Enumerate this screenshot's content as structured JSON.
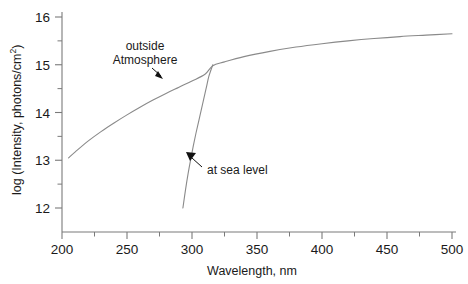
{
  "chart_data": {
    "type": "line",
    "title": "",
    "xlabel": "Wavelength, nm",
    "ylabel_parts": {
      "prefix": "log (Intensity, photons/cm",
      "superscript": "2",
      "suffix": ")"
    },
    "ylabel": "log (Intensity, photons/cm2)",
    "xlim": [
      200,
      500
    ],
    "ylim": [
      12,
      16
    ],
    "xticks": [
      200,
      250,
      300,
      350,
      400,
      450,
      500
    ],
    "xtick_labels": [
      "200",
      "250",
      "300",
      "350",
      "400",
      "450",
      "500"
    ],
    "yticks": [
      12,
      13,
      14,
      15,
      16
    ],
    "ytick_labels": [
      "12",
      "13",
      "14",
      "15",
      "16"
    ],
    "x_minor_step": 25,
    "y_minor_step": 0.5,
    "grid": false,
    "legend_position": "none",
    "series": [
      {
        "name": "outside Atmosphere",
        "x": [
          205,
          210,
          220,
          230,
          240,
          250,
          260,
          270,
          280,
          290,
          300,
          310,
          316,
          325,
          340,
          360,
          380,
          400,
          420,
          440,
          460,
          480,
          500
        ],
        "y": [
          13.05,
          13.17,
          13.4,
          13.6,
          13.78,
          13.95,
          14.11,
          14.26,
          14.4,
          14.53,
          14.66,
          14.8,
          14.98,
          15.06,
          15.17,
          15.28,
          15.37,
          15.44,
          15.5,
          15.55,
          15.59,
          15.62,
          15.65
        ]
      },
      {
        "name": "at sea level",
        "x": [
          293,
          295,
          297,
          299,
          301,
          303,
          305,
          307,
          309,
          311,
          313,
          316
        ],
        "y": [
          12.0,
          12.38,
          12.72,
          13.02,
          13.3,
          13.56,
          13.8,
          14.04,
          14.28,
          14.52,
          14.76,
          15.0
        ]
      }
    ],
    "annotations": [
      {
        "id": "outside-atmosphere",
        "lines": [
          "outside",
          "Atmosphere"
        ],
        "text": "outside Atmosphere",
        "arrow": "down-right"
      },
      {
        "id": "at-sea-level",
        "lines": [
          "at sea level"
        ],
        "text": "at sea level",
        "arrow": "down-left"
      }
    ],
    "colors": {
      "curve": "#8a8a8a",
      "axis": "#7a7a7a",
      "text": "#1a1a1a",
      "background": "#ffffff"
    }
  }
}
